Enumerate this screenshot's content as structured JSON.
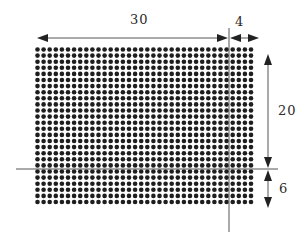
{
  "diagram": {
    "colors": {
      "dot": "#1e1e1e",
      "line": "#555555",
      "arrow": "#222222",
      "background": "#ffffff"
    },
    "grid": {
      "columns": 36,
      "rows": 26,
      "origin_x": 37.5,
      "origin_y": 49.5,
      "pitch_x": 6.1,
      "pitch_y": 6.1,
      "dot_radius": 2.3
    },
    "guide_lines": {
      "vertical": {
        "x": 229,
        "y1": 28,
        "y2": 232
      },
      "horizontal": {
        "y": 169,
        "x1": 16,
        "x2": 278
      }
    },
    "dimensions": {
      "width_main": {
        "label": "30",
        "from_x": 37,
        "to_x": 229,
        "y": 38
      },
      "width_extra": {
        "label": "4",
        "from_x": 229,
        "to_x": 259,
        "y": 38
      },
      "height_main": {
        "label": "20",
        "from_y": 54,
        "to_y": 169,
        "x": 268
      },
      "height_extra": {
        "label": "6",
        "from_y": 169,
        "to_y": 208,
        "x": 268
      }
    }
  }
}
